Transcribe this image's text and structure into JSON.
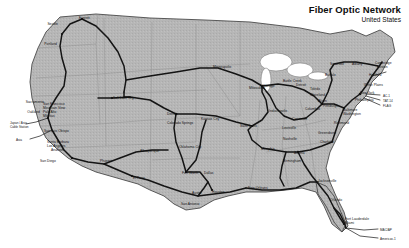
{
  "title": {
    "main": "Fiber Optic Network",
    "subtitle": "United States"
  },
  "map": {
    "region": "United States",
    "land_fill": "#b4b4b4",
    "land_stroke": "#4a4a4a",
    "state_stroke": "#8d8d8d",
    "route_color": "#141414",
    "background": "#ffffff"
  },
  "cities": [
    {
      "name": "Everett",
      "x": 79,
      "y": 17,
      "align": "left"
    },
    {
      "name": "Seattle",
      "x": 58,
      "y": 23,
      "align": "right"
    },
    {
      "name": "Portland",
      "x": 57,
      "y": 43,
      "align": "right"
    },
    {
      "name": "Sacramento",
      "x": 44,
      "y": 101,
      "align": "right"
    },
    {
      "name": "Oakland",
      "x": 40,
      "y": 111,
      "align": "right"
    },
    {
      "name": "San Francisco",
      "x": 43,
      "y": 103,
      "align": "left"
    },
    {
      "name": "Mountain View",
      "x": 43,
      "y": 107,
      "align": "left"
    },
    {
      "name": "Palo Alto",
      "x": 43,
      "y": 111,
      "align": "left"
    },
    {
      "name": "Milpitas",
      "x": 43,
      "y": 115,
      "align": "left"
    },
    {
      "name": "San Luis Obispo",
      "x": 44,
      "y": 130,
      "align": "left"
    },
    {
      "name": "Santa Barbara",
      "x": 47,
      "y": 141,
      "align": "left"
    },
    {
      "name": "Los Angeles",
      "x": 47,
      "y": 145,
      "align": "left"
    },
    {
      "name": "Anaheim",
      "x": 51,
      "y": 149,
      "align": "left"
    },
    {
      "name": "San Diego",
      "x": 40,
      "y": 160,
      "align": "left"
    },
    {
      "name": "Salt Lake City",
      "x": 113,
      "y": 97,
      "align": "left"
    },
    {
      "name": "Denver",
      "x": 167,
      "y": 113,
      "align": "left"
    },
    {
      "name": "Colorado Springs",
      "x": 167,
      "y": 122,
      "align": "left"
    },
    {
      "name": "Phoenix",
      "x": 100,
      "y": 160,
      "align": "left"
    },
    {
      "name": "Albuquerque",
      "x": 140,
      "y": 150,
      "align": "left"
    },
    {
      "name": "El Paso",
      "x": 133,
      "y": 177,
      "align": "left"
    },
    {
      "name": "Minneapolis",
      "x": 213,
      "y": 66,
      "align": "left"
    },
    {
      "name": "Milwaukee",
      "x": 249,
      "y": 87,
      "align": "left"
    },
    {
      "name": "Chicago",
      "x": 262,
      "y": 85,
      "align": "left"
    },
    {
      "name": "Battle Creek",
      "x": 283,
      "y": 80,
      "align": "left"
    },
    {
      "name": "Detroit",
      "x": 296,
      "y": 84,
      "align": "left"
    },
    {
      "name": "Toledo",
      "x": 310,
      "y": 88,
      "align": "left"
    },
    {
      "name": "Akron",
      "x": 318,
      "y": 100,
      "align": "left"
    },
    {
      "name": "Pittsburgh",
      "x": 323,
      "y": 105,
      "align": "left"
    },
    {
      "name": "Columbus",
      "x": 305,
      "y": 108,
      "align": "left"
    },
    {
      "name": "Indianapolis",
      "x": 269,
      "y": 110,
      "align": "left"
    },
    {
      "name": "Cincinnati",
      "x": 292,
      "y": 118,
      "align": "left"
    },
    {
      "name": "Louisville",
      "x": 282,
      "y": 127,
      "align": "left"
    },
    {
      "name": "Saint Louis",
      "x": 240,
      "y": 125,
      "align": "left"
    },
    {
      "name": "Kansas City",
      "x": 201,
      "y": 118,
      "align": "left"
    },
    {
      "name": "Oklahoma City",
      "x": 179,
      "y": 146,
      "align": "left"
    },
    {
      "name": "Fort Worth",
      "x": 182,
      "y": 172,
      "align": "left"
    },
    {
      "name": "Dallas",
      "x": 204,
      "y": 172,
      "align": "left"
    },
    {
      "name": "Austin",
      "x": 192,
      "y": 192,
      "align": "left"
    },
    {
      "name": "San Antonio",
      "x": 181,
      "y": 203,
      "align": "left"
    },
    {
      "name": "Houston",
      "x": 212,
      "y": 191,
      "align": "left"
    },
    {
      "name": "Memphis",
      "x": 261,
      "y": 148,
      "align": "left"
    },
    {
      "name": "Nashville",
      "x": 283,
      "y": 138,
      "align": "left"
    },
    {
      "name": "Greensboro",
      "x": 318,
      "y": 132,
      "align": "left"
    },
    {
      "name": "Charlotte",
      "x": 320,
      "y": 141,
      "align": "left"
    },
    {
      "name": "Atlanta",
      "x": 294,
      "y": 152,
      "align": "left"
    },
    {
      "name": "Birmingham",
      "x": 283,
      "y": 160,
      "align": "left"
    },
    {
      "name": "New Orleans",
      "x": 248,
      "y": 187,
      "align": "left"
    },
    {
      "name": "Jacksonville",
      "x": 318,
      "y": 180,
      "align": "left"
    },
    {
      "name": "Orlando",
      "x": 330,
      "y": 199,
      "align": "left"
    },
    {
      "name": "Fort Lauderdale",
      "x": 345,
      "y": 218,
      "align": "left"
    },
    {
      "name": "Miami",
      "x": 345,
      "y": 222,
      "align": "left"
    },
    {
      "name": "Washington",
      "x": 343,
      "y": 113,
      "align": "left"
    },
    {
      "name": "Baltimore",
      "x": 343,
      "y": 109,
      "align": "left"
    },
    {
      "name": "Richmond",
      "x": 334,
      "y": 122,
      "align": "left"
    },
    {
      "name": "Philadelphia",
      "x": 355,
      "y": 99,
      "align": "left"
    },
    {
      "name": "New York",
      "x": 360,
      "y": 92,
      "align": "left"
    },
    {
      "name": "White Plains",
      "x": 364,
      "y": 84,
      "align": "left"
    },
    {
      "name": "Hartford",
      "x": 369,
      "y": 74,
      "align": "left"
    },
    {
      "name": "Cambridge",
      "x": 375,
      "y": 62,
      "align": "left"
    },
    {
      "name": "Boston",
      "x": 377,
      "y": 66,
      "align": "left"
    },
    {
      "name": "Albany",
      "x": 352,
      "y": 63,
      "align": "left"
    },
    {
      "name": "Syracuse",
      "x": 330,
      "y": 63,
      "align": "left"
    },
    {
      "name": "Buffalo",
      "x": 325,
      "y": 74,
      "align": "left"
    },
    {
      "name": "Cleveland",
      "x": 310,
      "y": 94,
      "align": "left"
    }
  ],
  "cable_landings": [
    {
      "name": "Japan / Asia",
      "x": 10,
      "y": 122,
      "note": "Cable Station"
    },
    {
      "name": "Cable Station",
      "x": 10,
      "y": 126,
      "note": ""
    },
    {
      "name": "Asia",
      "x": 16,
      "y": 139,
      "note": ""
    },
    {
      "name": "AC-1",
      "x": 383,
      "y": 95,
      "note": ""
    },
    {
      "name": "TAT-14",
      "x": 383,
      "y": 100,
      "note": ""
    },
    {
      "name": "FLAG",
      "x": 383,
      "y": 105,
      "note": ""
    },
    {
      "name": "MAC/AP",
      "x": 380,
      "y": 229,
      "note": ""
    },
    {
      "name": "Americas-1",
      "x": 380,
      "y": 238,
      "note": ""
    }
  ]
}
